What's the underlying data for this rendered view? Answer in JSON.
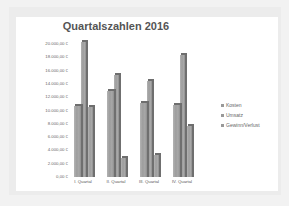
{
  "chart_data": {
    "type": "bar",
    "title": "Quartalszahlen 2016",
    "categories": [
      "I. Quartal",
      "II. Quartal",
      "III. Quartal",
      "IV. Quartal"
    ],
    "series": [
      {
        "name": "Kosten",
        "values": [
          10750,
          12900,
          11200,
          10800
        ]
      },
      {
        "name": "Umsatz",
        "values": [
          20300,
          15300,
          14400,
          18300
        ]
      },
      {
        "name": "Gewinn/Verlust",
        "values": [
          10500,
          2900,
          3300,
          7700
        ]
      }
    ],
    "yticks": [
      "20.000,00 €",
      "18.000,00 €",
      "16.000,00 €",
      "14.000,00 €",
      "12.000,00 €",
      "10.000,00 €",
      "8.000,00 €",
      "6.000,00 €",
      "4.000,00 €",
      "2.000,00 €",
      "0,00 €"
    ],
    "xlabel": "",
    "ylabel": "",
    "ylim": [
      0,
      20000
    ],
    "legend_position": "right",
    "grid": false,
    "style": "3d-bar-gray"
  }
}
